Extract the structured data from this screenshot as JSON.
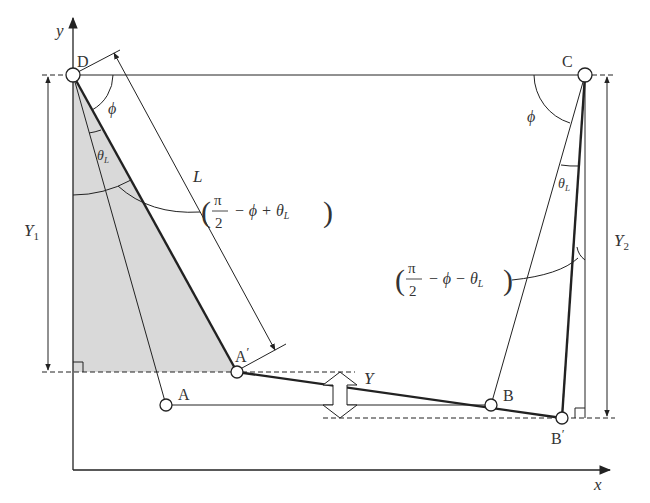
{
  "axes": {
    "x_label": "x",
    "y_label": "y"
  },
  "points": {
    "D": "D",
    "C": "C",
    "A": "A",
    "B": "B",
    "A_prime": "A",
    "B_prime": "B",
    "prime_mark": "′"
  },
  "dimensions": {
    "L": "L",
    "Y": "Y",
    "Y1_main": "Y",
    "Y1_sub": "1",
    "Y2_main": "Y",
    "Y2_sub": "2"
  },
  "angles": {
    "phi_left": "ϕ",
    "phi_right": "ϕ",
    "theta_main": "θ",
    "theta_sub": "L"
  },
  "annotations": {
    "left_expr": {
      "open": "(",
      "num": "π",
      "den": "2",
      "rest_a": "− ϕ + θ",
      "sub": "L",
      "close": ")"
    },
    "right_expr": {
      "open": "(",
      "num": "π",
      "den": "2",
      "rest_a": "− ϕ − θ",
      "sub": "L",
      "close": ")"
    }
  },
  "colors": {
    "line": "#222222",
    "shade": "#d9d9d9",
    "text": "#333333"
  }
}
